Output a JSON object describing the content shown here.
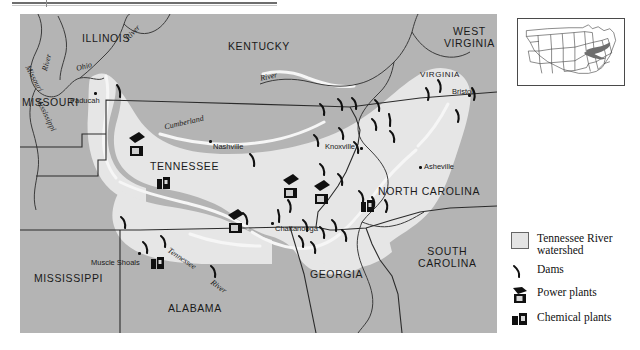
{
  "figure": {
    "rule_present": true
  },
  "map": {
    "states": [
      {
        "name": "ILLINOIS",
        "x": 62,
        "y": 18
      },
      {
        "name": "KENTUCKY",
        "x": 215,
        "y": 26
      },
      {
        "name": "MISSOURI",
        "x": 3,
        "y": 82
      },
      {
        "name": "TENNESSEE",
        "x": 138,
        "y": 146
      },
      {
        "name": "MISSISSIPPI",
        "x": 24,
        "y": 260
      },
      {
        "name": "ALABAMA",
        "x": 152,
        "y": 290
      },
      {
        "name": "GEORGIA",
        "x": 295,
        "y": 256
      },
      {
        "name": "WEST VIRGINIA",
        "x": 440,
        "y": 14
      },
      {
        "name": "VIRGINIA",
        "x": 404,
        "y": 57
      },
      {
        "name": "NORTH CAROLINA",
        "x": 369,
        "y": 172
      },
      {
        "name": "SOUTH CAROLINA",
        "x": 410,
        "y": 238
      }
    ],
    "cities": [
      {
        "name": "Paducah",
        "x": 54,
        "y": 82
      },
      {
        "name": "Nashville",
        "x": 169,
        "y": 129
      },
      {
        "name": "Knoxville",
        "x": 304,
        "y": 131
      },
      {
        "name": "Chattanooga",
        "x": 252,
        "y": 209
      },
      {
        "name": "Muscle Shoals",
        "x": 72,
        "y": 240
      },
      {
        "name": "Bristol",
        "x": 434,
        "y": 75
      },
      {
        "name": "Asheville",
        "x": 400,
        "y": 150
      }
    ],
    "rivers": [
      {
        "name": "River",
        "x": 110,
        "y": 7,
        "rot": -42
      },
      {
        "name": "Ohio",
        "x": 60,
        "y": 54,
        "rot": -18
      },
      {
        "name": "River",
        "x": 22,
        "y": 42,
        "rot": -78
      },
      {
        "name": "Mississippi",
        "x": 16,
        "y": 95,
        "rot": 65
      },
      {
        "name": "Missouri",
        "x": 4,
        "y": 60,
        "rot": 62
      },
      {
        "name": "River",
        "x": 245,
        "y": 62,
        "rot": -12
      },
      {
        "name": "Cumberland",
        "x": 148,
        "y": 104,
        "rot": -14
      },
      {
        "name": "Tennessee",
        "x": 150,
        "y": 245,
        "rot": 33
      },
      {
        "name": "River",
        "x": 192,
        "y": 272,
        "rot": 36
      }
    ],
    "symbol_counts": {
      "dams": 34,
      "power_plants": 4,
      "chemical_plants": 3
    }
  },
  "legend": {
    "items": [
      {
        "icon": "watershed-swatch",
        "label": "Tennessee River watershed"
      },
      {
        "icon": "dam-icon",
        "label": "Dams"
      },
      {
        "icon": "power-plant-icon",
        "label": "Power plants"
      },
      {
        "icon": "chemical-plant-icon",
        "label": "Chemical plants"
      }
    ]
  },
  "inset": {
    "title": "United States locator map",
    "highlight": "Tennessee River watershed"
  },
  "colors": {
    "land": "#b4b4b4",
    "watershed": "#e6e6e6",
    "water": "#f4f4f4",
    "border": "#2b2b2b",
    "symbol": "#111111",
    "page": "#ffffff"
  }
}
